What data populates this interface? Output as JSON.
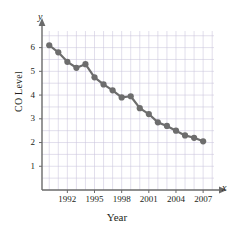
{
  "chart_data": {
    "type": "line",
    "title": "",
    "subtitle": "",
    "xlabel": "Year",
    "ylabel": "CO Level",
    "x_axis_letter": "x",
    "y_axis_letter": "y",
    "xlim": [
      1989.2,
      2008.2
    ],
    "ylim": [
      0,
      6.7
    ],
    "xticks": [
      1992,
      1995,
      1998,
      2001,
      2004,
      2007
    ],
    "xtick_labels": [
      "1992",
      "1995",
      "1998",
      "2001",
      "2004",
      "2007"
    ],
    "yticks": [
      1,
      2,
      3,
      4,
      5,
      6
    ],
    "ytick_labels": [
      "1",
      "2",
      "3",
      "4",
      "5",
      "6"
    ],
    "grid": true,
    "grid_color": "#c9c4dd",
    "series_color": "#6d6d6d",
    "axis_color": "#6a6a6a",
    "legend": null,
    "x": [
      1990,
      1991,
      1992,
      1993,
      1994,
      1995,
      1996,
      1997,
      1998,
      1999,
      2000,
      2001,
      2002,
      2003,
      2004,
      2005,
      2006,
      2007
    ],
    "values": [
      6.1,
      5.8,
      5.4,
      5.15,
      5.3,
      4.75,
      4.45,
      4.2,
      3.9,
      3.95,
      3.45,
      3.2,
      2.85,
      2.7,
      2.5,
      2.3,
      2.2,
      2.05
    ],
    "marker": "circle",
    "marker_size": 3.1,
    "line_width": 2.2
  }
}
